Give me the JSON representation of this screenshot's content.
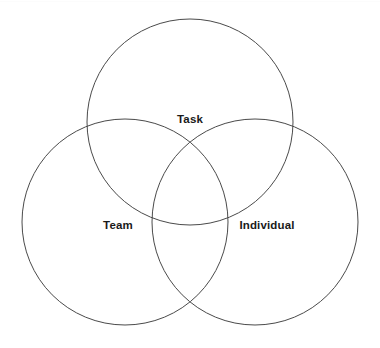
{
  "diagram": {
    "type": "venn-3-circle",
    "title": "",
    "canvas": {
      "width": 380,
      "height": 348,
      "background": "#ffffff"
    },
    "stroke_color": "#4a4a4a",
    "stroke_width": 1,
    "fill": "none",
    "label_color": "#1a1a1a",
    "circles": [
      {
        "id": "task",
        "label": "Task",
        "cx": 190,
        "cy": 122,
        "r": 103,
        "label_x": 190,
        "label_y": 123
      },
      {
        "id": "team",
        "label": "Team",
        "cx": 125,
        "cy": 222,
        "r": 103,
        "label_x": 118,
        "label_y": 229
      },
      {
        "id": "individual",
        "label": "Individual",
        "cx": 255,
        "cy": 222,
        "r": 103,
        "label_x": 267,
        "label_y": 229
      }
    ]
  }
}
